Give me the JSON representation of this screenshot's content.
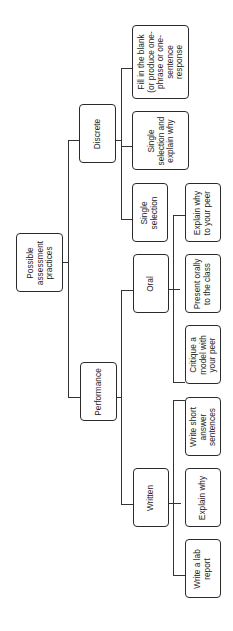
{
  "diagram": {
    "orientation": "rotated-90-ccw",
    "root": {
      "label": "Possible\nassessment\npractices"
    },
    "level1": {
      "discrete": {
        "label": "Discrete"
      },
      "performance": {
        "label": "Performance"
      }
    },
    "level2": {
      "fill_blank": {
        "label": "Fill in the blank\n(or produce one-\nphrase or one-\nsentence\nresponse"
      },
      "single_explain": {
        "label": "Single\nselection and\nexplain why"
      },
      "single_selection": {
        "label": "Single\nselection"
      },
      "oral": {
        "label": "Oral"
      },
      "written": {
        "label": "Written"
      }
    },
    "leaves": {
      "explain_peer": {
        "label": "Explain why\nto your peer"
      },
      "present_orally": {
        "label": "Present orally\nto the class"
      },
      "critique": {
        "label": "Critique a\nmodel with\nyour peer"
      },
      "write_short": {
        "label": "Write short\nanswer\nsentences"
      },
      "explain_why": {
        "label": "Explain why"
      },
      "lab_report": {
        "label": "Write a lab\nreport"
      }
    }
  }
}
